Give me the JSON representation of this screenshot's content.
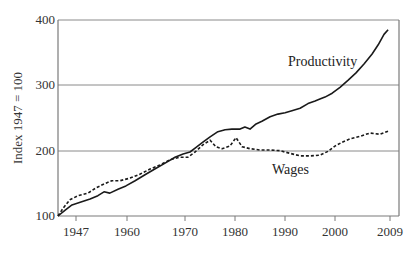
{
  "chart_data": {
    "type": "line",
    "title": "",
    "xlabel": "",
    "ylabel": "Index 1947 = 100",
    "ylim": [
      100,
      400
    ],
    "yticks": [
      "100",
      "200",
      "300",
      "400"
    ],
    "xticks": [
      "1947",
      "1960",
      "1970",
      "1980",
      "1990",
      "2000",
      "2009"
    ],
    "grid": "horizontal at 200, 300, 400",
    "legend": "inline labels",
    "annotations": [
      "Productivity",
      "Wages"
    ],
    "series": [
      {
        "name": "Productivity",
        "style": "solid",
        "points": [
          [
            0.0,
            100
          ],
          [
            0.021,
            109
          ],
          [
            0.041,
            117
          ],
          [
            0.065,
            121
          ],
          [
            0.094,
            126
          ],
          [
            0.117,
            131
          ],
          [
            0.135,
            137
          ],
          [
            0.152,
            135
          ],
          [
            0.176,
            141
          ],
          [
            0.199,
            146
          ],
          [
            0.226,
            154
          ],
          [
            0.255,
            163
          ],
          [
            0.284,
            172
          ],
          [
            0.314,
            181
          ],
          [
            0.343,
            190
          ],
          [
            0.367,
            195
          ],
          [
            0.387,
            198
          ],
          [
            0.402,
            204
          ],
          [
            0.425,
            213
          ],
          [
            0.446,
            221
          ],
          [
            0.469,
            229
          ],
          [
            0.49,
            232
          ],
          [
            0.51,
            233
          ],
          [
            0.534,
            233
          ],
          [
            0.548,
            236
          ],
          [
            0.563,
            233
          ],
          [
            0.581,
            241
          ],
          [
            0.598,
            245
          ],
          [
            0.622,
            252
          ],
          [
            0.645,
            256
          ],
          [
            0.666,
            258
          ],
          [
            0.686,
            261
          ],
          [
            0.71,
            265
          ],
          [
            0.733,
            272
          ],
          [
            0.754,
            276
          ],
          [
            0.768,
            279
          ],
          [
            0.783,
            282
          ],
          [
            0.804,
            288
          ],
          [
            0.827,
            297
          ],
          [
            0.851,
            308
          ],
          [
            0.874,
            319
          ],
          [
            0.898,
            333
          ],
          [
            0.921,
            348
          ],
          [
            0.939,
            362
          ],
          [
            0.956,
            378
          ],
          [
            0.968,
            385
          ]
        ]
      },
      {
        "name": "Wages",
        "style": "dashed",
        "points": [
          [
            0.0,
            100
          ],
          [
            0.015,
            112
          ],
          [
            0.035,
            125
          ],
          [
            0.059,
            131
          ],
          [
            0.088,
            135
          ],
          [
            0.111,
            143
          ],
          [
            0.135,
            149
          ],
          [
            0.158,
            154
          ],
          [
            0.182,
            154
          ],
          [
            0.211,
            158
          ],
          [
            0.24,
            164
          ],
          [
            0.27,
            172
          ],
          [
            0.299,
            178
          ],
          [
            0.328,
            186
          ],
          [
            0.358,
            190
          ],
          [
            0.381,
            190
          ],
          [
            0.402,
            198
          ],
          [
            0.425,
            209
          ],
          [
            0.446,
            216
          ],
          [
            0.463,
            206
          ],
          [
            0.481,
            203
          ],
          [
            0.504,
            207
          ],
          [
            0.522,
            220
          ],
          [
            0.54,
            206
          ],
          [
            0.563,
            203
          ],
          [
            0.592,
            201
          ],
          [
            0.622,
            201
          ],
          [
            0.651,
            200
          ],
          [
            0.68,
            196
          ],
          [
            0.71,
            192
          ],
          [
            0.739,
            192
          ],
          [
            0.768,
            193
          ],
          [
            0.792,
            199
          ],
          [
            0.812,
            207
          ],
          [
            0.833,
            213
          ],
          [
            0.856,
            218
          ],
          [
            0.886,
            222
          ],
          [
            0.915,
            227
          ],
          [
            0.944,
            225
          ],
          [
            0.968,
            230
          ]
        ]
      }
    ]
  },
  "axis": {
    "y_title": "Index 1947 = 100",
    "y_ticks": [
      "400",
      "300",
      "200",
      "100"
    ],
    "x_ticks": [
      "1947",
      "1960",
      "1970",
      "1980",
      "1990",
      "2000",
      "2009"
    ]
  },
  "labels": {
    "productivity": "Productivity",
    "wages": "Wages"
  },
  "colors": {
    "line": "#1a1a1a",
    "grid": "#8a8a8a",
    "frame": "#7a7a7a",
    "text": "#333333"
  }
}
